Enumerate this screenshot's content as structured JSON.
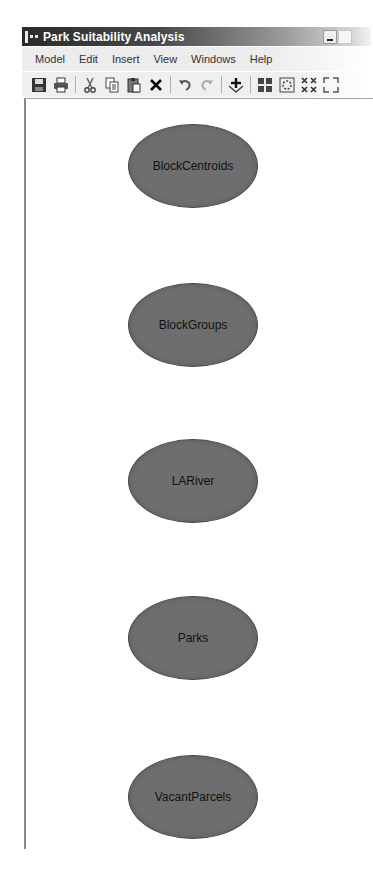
{
  "window": {
    "title": "Park Suitability Analysis",
    "controls": [
      "minimize",
      "maximize"
    ]
  },
  "menubar": {
    "items": [
      "Model",
      "Edit",
      "Insert",
      "View",
      "Windows",
      "Help"
    ]
  },
  "toolbar": {
    "buttons": [
      {
        "name": "save",
        "icon": "floppy-disk-icon"
      },
      {
        "name": "print",
        "icon": "printer-icon"
      },
      {
        "name": "cut",
        "icon": "scissors-icon"
      },
      {
        "name": "copy",
        "icon": "copy-icon"
      },
      {
        "name": "paste",
        "icon": "paste-icon"
      },
      {
        "name": "delete",
        "icon": "x-icon"
      },
      {
        "name": "undo",
        "icon": "undo-icon"
      },
      {
        "name": "redo",
        "icon": "redo-icon"
      },
      {
        "name": "add-data",
        "icon": "add-data-icon"
      },
      {
        "name": "auto-layout",
        "icon": "grid-layout-icon"
      },
      {
        "name": "full-extent",
        "icon": "full-extent-icon"
      },
      {
        "name": "zoom-in",
        "icon": "zoom-in-fixed-icon"
      },
      {
        "name": "zoom-out",
        "icon": "zoom-out-fixed-icon"
      }
    ]
  },
  "canvas": {
    "node_color": "#6e6e6e",
    "nodes": [
      {
        "label": "BlockCentroids",
        "display": "BlockCentroi ds"
      },
      {
        "label": "BlockGroups",
        "display": "BlockGroups"
      },
      {
        "label": "LARiver",
        "display": "LARiver"
      },
      {
        "label": "Parks",
        "display": "Parks"
      },
      {
        "label": "VacantParcels",
        "display": "VacantParce ls"
      }
    ]
  }
}
